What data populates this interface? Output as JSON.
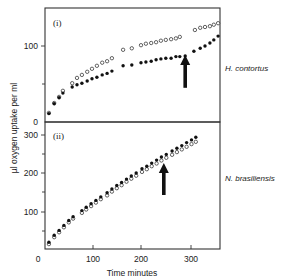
{
  "chart_data": [
    {
      "type": "scatter",
      "panel_label": "(i)",
      "species_label": "H. contortus",
      "ylabel": "µl oxygen uptake per ml",
      "xlabel": "Time minutes",
      "xlim": [
        0,
        360
      ],
      "ylim": [
        0,
        150
      ],
      "yticks": [
        0,
        50,
        100
      ],
      "ytick_labels": [
        "0",
        "",
        "100"
      ],
      "xticks": [
        0,
        100,
        200,
        300
      ],
      "grid": false,
      "arrow": {
        "x": 289,
        "y_tip": 88,
        "y_base": 45
      },
      "series": [
        {
          "name": "open",
          "marker": "open-circle",
          "x": [
            8,
            19,
            29,
            37,
            56,
            66,
            76,
            87,
            97,
            107,
            118,
            128,
            138,
            161,
            179,
            198,
            208,
            219,
            229,
            239,
            249,
            260,
            270,
            278,
            309,
            320,
            330,
            340,
            348,
            357
          ],
          "y": [
            12,
            25,
            33,
            41,
            51,
            58,
            62,
            66,
            70,
            74,
            78,
            80,
            84,
            95,
            97,
            101,
            103,
            104,
            105,
            107,
            108,
            109,
            110,
            112,
            121,
            124,
            125,
            126,
            128,
            130
          ]
        },
        {
          "name": "filled",
          "marker": "filled-circle",
          "x": [
            8,
            19,
            29,
            37,
            56,
            66,
            76,
            87,
            97,
            107,
            118,
            128,
            138,
            161,
            179,
            198,
            208,
            219,
            229,
            239,
            249,
            260,
            270,
            278,
            289,
            307,
            320,
            330,
            340,
            348,
            357
          ],
          "y": [
            11,
            24,
            32,
            38,
            46,
            49,
            51,
            54,
            57,
            59,
            62,
            64,
            67,
            74,
            75,
            78,
            79,
            80,
            82,
            83,
            84,
            84,
            86,
            86,
            87,
            93,
            97,
            100,
            104,
            108,
            113
          ]
        }
      ]
    },
    {
      "type": "scatter",
      "panel_label": "(ii)",
      "species_label": "N. brasiliensis",
      "ylabel": "µl oxygen uptake per ml",
      "xlabel": "Time minutes",
      "xlim": [
        0,
        360
      ],
      "ylim": [
        0,
        300
      ],
      "yticks": [
        50,
        100,
        150,
        200,
        250,
        300
      ],
      "ytick_labels": [
        "",
        "100",
        "",
        "200",
        "",
        "300"
      ],
      "xticks": [
        0,
        100,
        200,
        300
      ],
      "xtick_labels": [
        "0",
        "100",
        "200",
        "300"
      ],
      "grid": false,
      "arrow": {
        "x": 245,
        "y_tip": 226,
        "y_base": 142
      },
      "series": [
        {
          "name": "open",
          "marker": "open-circle",
          "x": [
            8,
            19,
            29,
            39,
            49,
            58,
            76,
            85,
            95,
            105,
            115,
            128,
            138,
            148,
            158,
            168,
            178,
            188,
            200,
            210,
            220,
            230,
            240,
            250,
            262,
            272,
            282,
            292,
            302,
            311
          ],
          "y": [
            13,
            31,
            44,
            57,
            70,
            80,
            95,
            104,
            113,
            122,
            131,
            141,
            151,
            160,
            168,
            177,
            185,
            193,
            203,
            210,
            218,
            225,
            233,
            240,
            248,
            255,
            262,
            269,
            276,
            282
          ]
        },
        {
          "name": "filled",
          "marker": "filled-circle",
          "x": [
            8,
            19,
            29,
            39,
            49,
            58,
            76,
            85,
            95,
            105,
            115,
            128,
            138,
            148,
            158,
            168,
            178,
            188,
            200,
            210,
            220,
            230,
            240,
            250,
            262,
            272,
            282,
            292,
            302,
            311
          ],
          "y": [
            18,
            36,
            49,
            62,
            75,
            85,
            101,
            110,
            119,
            128,
            137,
            148,
            158,
            167,
            175,
            184,
            192,
            200,
            211,
            218,
            226,
            234,
            242,
            249,
            258,
            265,
            272,
            280,
            287,
            294
          ]
        }
      ]
    }
  ],
  "labels": {
    "ylabel": "µl oxygen uptake per ml",
    "xlabel": "Time minutes",
    "panel_i": "(i)",
    "panel_ii": "(ii)",
    "species_i": "H. contortus",
    "species_ii": "N. brasiliensis",
    "y_i_0": "0",
    "y_i_100": "100",
    "y_ii_100": "100",
    "y_ii_200": "200",
    "y_ii_300": "300",
    "x_0": "0",
    "x_100": "100",
    "x_200": "200",
    "x_300": "300"
  }
}
